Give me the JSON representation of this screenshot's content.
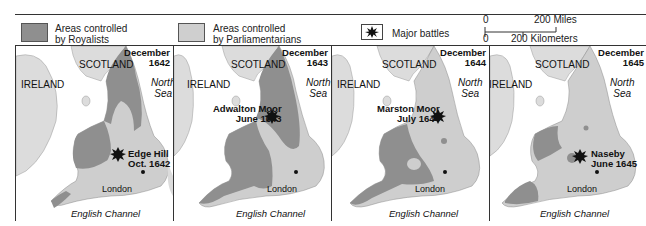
{
  "legend": {
    "royalists": {
      "line1": "Areas controlled",
      "line2": "by Royalists",
      "color": "#8f8f8f"
    },
    "parliamentarians": {
      "line1": "Areas controlled",
      "line2": "by Parliamentarians",
      "color": "#cfcfcf"
    },
    "battles": {
      "label": "Major battles"
    },
    "scale": {
      "zero_top": "0",
      "miles": "200 Miles",
      "zero_bottom": "0",
      "km": "200 Kilometers"
    }
  },
  "colors": {
    "royalist": "#8f8f8f",
    "parliament": "#cecece",
    "land_other": "#dcdcdc",
    "sea": "#ffffff"
  },
  "panels": [
    {
      "date_line1": "December",
      "date_line2": "1642",
      "scotland": "SCOTLAND",
      "ireland": "IRELAND",
      "sea_line1": "North",
      "sea_line2": "Sea",
      "battle_line1": "Edge Hill",
      "battle_line2": "Oct. 1642",
      "london": "London",
      "channel": "English Channel"
    },
    {
      "date_line1": "December",
      "date_line2": "1643",
      "scotland": "SCOTLAND",
      "ireland": "IRELAND",
      "sea_line1": "North",
      "sea_line2": "Sea",
      "battle_line1": "Adwalton Moor",
      "battle_line2": "June 1643",
      "london": "London",
      "channel": "English Channel"
    },
    {
      "date_line1": "December",
      "date_line2": "1644",
      "scotland": "SCOTLAND",
      "ireland": "IRELAND",
      "sea_line1": "North",
      "sea_line2": "Sea",
      "battle_line1": "Marston Moor",
      "battle_line2": "July 1644",
      "london": "London",
      "channel": "English Channel"
    },
    {
      "date_line1": "December",
      "date_line2": "1645",
      "scotland": "SCOTLAND",
      "ireland": "IRELAND",
      "sea_line1": "North",
      "sea_line2": "Sea",
      "battle_line1": "Naseby",
      "battle_line2": "June 1645",
      "london": "London",
      "channel": "English Channel"
    }
  ]
}
